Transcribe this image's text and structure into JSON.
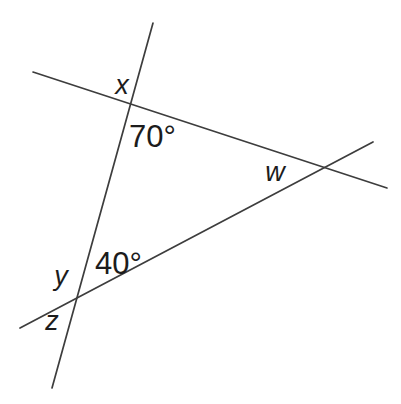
{
  "diagram": {
    "background_color": "#ffffff",
    "line_color": "#3d3d3d",
    "line_width": 1.7,
    "label_color": "#1c1c1c",
    "width": 401,
    "height": 404,
    "lines": [
      {
        "name": "steep-transversal-line",
        "x1": 153,
        "y1": 23,
        "x2": 52,
        "y2": 388
      },
      {
        "name": "upper-transversal-line",
        "x1": 33,
        "y1": 72,
        "x2": 387,
        "y2": 188
      },
      {
        "name": "lower-transversal-line",
        "x1": 20,
        "y1": 328,
        "x2": 373,
        "y2": 142
      }
    ],
    "labels": [
      {
        "name": "angle-label-x",
        "text": "x",
        "x": 122,
        "y": 94,
        "style": "italic",
        "size": 27,
        "anchor": "middle"
      },
      {
        "name": "angle-label-70deg",
        "text": "70°",
        "x": 129,
        "y": 147,
        "style": "normal",
        "size": 31,
        "anchor": "start"
      },
      {
        "name": "angle-label-w",
        "text": "w",
        "x": 275,
        "y": 181,
        "style": "italic",
        "size": 27,
        "anchor": "middle"
      },
      {
        "name": "angle-label-40deg",
        "text": "40°",
        "x": 95,
        "y": 274,
        "style": "normal",
        "size": 31,
        "anchor": "start"
      },
      {
        "name": "angle-label-y",
        "text": "y",
        "x": 61,
        "y": 285,
        "style": "italic",
        "size": 27,
        "anchor": "middle"
      },
      {
        "name": "angle-label-z",
        "text": "z",
        "x": 52,
        "y": 330,
        "style": "italic",
        "size": 27,
        "anchor": "middle"
      }
    ],
    "angle_values": {
      "top_interior_angle": "70°",
      "bottom_interior_angle": "40°",
      "unknown_angles": [
        "x",
        "w",
        "y",
        "z"
      ]
    }
  }
}
